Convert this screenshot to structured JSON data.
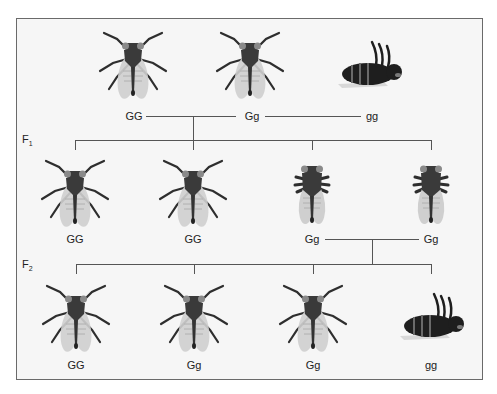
{
  "diagram": {
    "title": "",
    "parents": [
      {
        "genotype": "GG",
        "phenotype": "normal-wing"
      },
      {
        "genotype": "Gg",
        "phenotype": "normal-wing"
      },
      {
        "genotype": "gg",
        "phenotype": "dead"
      }
    ],
    "generations": [
      {
        "label": "F",
        "subscript": "1",
        "offspring": [
          {
            "genotype": "GG",
            "phenotype": "normal-wing"
          },
          {
            "genotype": "GG",
            "phenotype": "normal-wing"
          },
          {
            "genotype": "Gg",
            "phenotype": "short-leg"
          },
          {
            "genotype": "Gg",
            "phenotype": "short-leg"
          }
        ]
      },
      {
        "label": "F",
        "subscript": "2",
        "offspring": [
          {
            "genotype": "GG",
            "phenotype": "normal-wing"
          },
          {
            "genotype": "Gg",
            "phenotype": "normal-wing"
          },
          {
            "genotype": "Gg",
            "phenotype": "normal-wing"
          },
          {
            "genotype": "gg",
            "phenotype": "dead"
          }
        ]
      }
    ],
    "colors": {
      "frame_border": "#6a6a6a",
      "frame_bg": "#f6f6f6",
      "fly_body": "#3a3a3a",
      "fly_wing": "#c8c8c8",
      "line": "#555555"
    }
  }
}
